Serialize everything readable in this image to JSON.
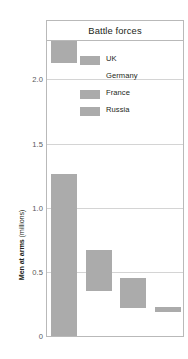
{
  "chart_data": {
    "type": "bar",
    "bar_style": "floating-range",
    "title": "Battle forces",
    "xlabel": "",
    "ylabel": "Men at arms (millions)",
    "ylim": [
      0,
      2.3
    ],
    "yticks": [
      "0",
      "0.5",
      "1.0",
      "1.5",
      "2.0"
    ],
    "ytick_values": [
      0,
      0.5,
      1.0,
      1.5,
      2.0
    ],
    "grid": "horizontal",
    "legend_position": "inside-upper-right",
    "categories": [
      "UK",
      "Germany",
      "France",
      "Russia"
    ],
    "series": [
      {
        "name": "range-low",
        "values": [
          0.0,
          0.35,
          0.22,
          0.19
        ]
      },
      {
        "name": "range-high",
        "values": [
          1.26,
          0.67,
          0.45,
          0.23
        ]
      }
    ],
    "extra_segments": [
      {
        "category": "UK",
        "low": 2.13,
        "high": 2.3,
        "note": "upper segment of UK bar at top of plot"
      }
    ],
    "bar_color": "#ababab",
    "grid_color": "#d4d4d4",
    "frame_color": "#b9b9b9",
    "text_color": "#231f20",
    "tick_text_color": "#58595b"
  },
  "chart": {
    "title": "Battle forces",
    "axis_title_main": "Men at arms",
    "axis_title_unit": " (millions)"
  },
  "legend": {
    "items": [
      {
        "label": "UK",
        "swatch": "filled"
      },
      {
        "label": "Germany",
        "swatch": "blank"
      },
      {
        "label": "France",
        "swatch": "filled"
      },
      {
        "label": "Russia",
        "swatch": "filled"
      }
    ]
  }
}
